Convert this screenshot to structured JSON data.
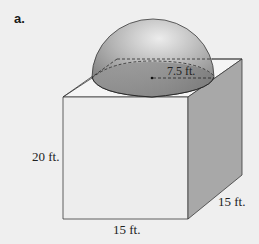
{
  "figure": {
    "part_label": "a.",
    "shapes": [
      "cube",
      "hemisphere"
    ],
    "labels": {
      "radius": "7.5 ft.",
      "height": "20 ft.",
      "width": "15 ft.",
      "depth": "15 ft."
    },
    "colors": {
      "background": "#efefef",
      "front_face": "#eeeeee",
      "top_face": "#f4f4f4",
      "side_face": "#a9a9a9",
      "hemisphere_light": "#e6e6e6",
      "hemisphere_dark": "#7d7d7d",
      "edge": "#3a3a3a"
    }
  }
}
